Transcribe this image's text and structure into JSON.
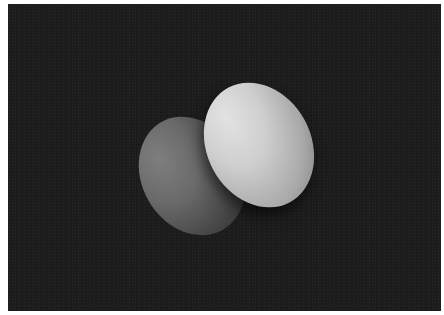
{
  "image": {
    "description": "Two glowing egg-shaped lobes on a dark background",
    "background_color": "#1d1d1d",
    "border_color": "#ffffff",
    "objects": [
      {
        "name": "dim-lobe",
        "color_top": "#7e7e7e",
        "color_bottom": "#262626"
      },
      {
        "name": "bright-lobe",
        "color_top": "#e2e2e2",
        "color_bottom": "#6f6f6f"
      }
    ]
  }
}
